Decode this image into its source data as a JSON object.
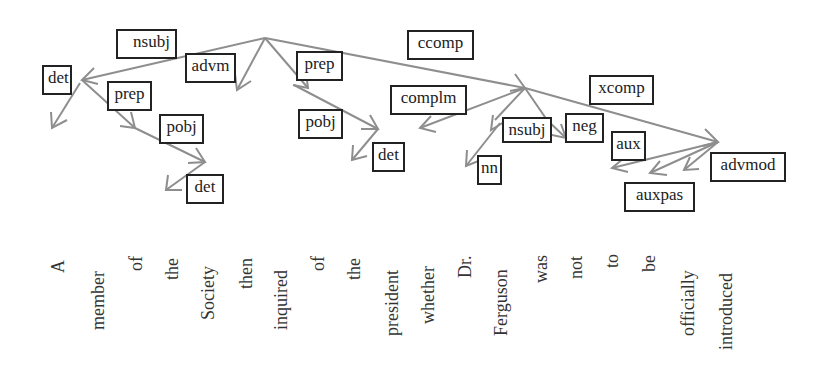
{
  "diagram": {
    "type": "dependency-parse",
    "root": "inquired",
    "edge_color": "#8e8e8e",
    "label_border_color": "#222222",
    "tokens": [
      "A",
      "member",
      "of",
      "the",
      "Society",
      "then",
      "inquired",
      "of",
      "the",
      "president",
      "whether",
      "Dr.",
      "Ferguson",
      "was",
      "not",
      "to",
      "be",
      "officially",
      "introduced"
    ],
    "labels": {
      "nsubj_1": "nsubj",
      "det_1": "det",
      "advm": "advm",
      "prep_1": "prep",
      "pobj_1": "pobj",
      "det_2": "det",
      "prep_2": "prep",
      "pobj_2": "pobj",
      "det_3": "det",
      "ccomp": "ccomp",
      "complm": "complm",
      "nsubj_2": "nsubj",
      "nn": "nn",
      "neg": "neg",
      "xcomp": "xcomp",
      "aux": "aux",
      "auxpas": "auxpas",
      "advmod": "advmod"
    },
    "edges": [
      {
        "head": "inquired",
        "dep": "member",
        "label": "nsubj"
      },
      {
        "head": "member",
        "dep": "A",
        "label": "det"
      },
      {
        "head": "member",
        "dep": "of",
        "label": "prep"
      },
      {
        "head": "of",
        "dep": "Society",
        "label": "pobj"
      },
      {
        "head": "Society",
        "dep": "the",
        "label": "det"
      },
      {
        "head": "inquired",
        "dep": "then",
        "label": "advm"
      },
      {
        "head": "inquired",
        "dep": "of",
        "label": "prep"
      },
      {
        "head": "of",
        "dep": "president",
        "label": "pobj"
      },
      {
        "head": "president",
        "dep": "the",
        "label": "det"
      },
      {
        "head": "inquired",
        "dep": "was",
        "label": "ccomp"
      },
      {
        "head": "was",
        "dep": "whether",
        "label": "complm"
      },
      {
        "head": "was",
        "dep": "Ferguson",
        "label": "nsubj"
      },
      {
        "head": "Ferguson",
        "dep": "Dr.",
        "label": "nn"
      },
      {
        "head": "was",
        "dep": "not",
        "label": "neg"
      },
      {
        "head": "was",
        "dep": "introduced",
        "label": "xcomp"
      },
      {
        "head": "introduced",
        "dep": "to",
        "label": "aux"
      },
      {
        "head": "introduced",
        "dep": "be",
        "label": "auxpas"
      },
      {
        "head": "introduced",
        "dep": "officially",
        "label": "advmod"
      }
    ]
  }
}
